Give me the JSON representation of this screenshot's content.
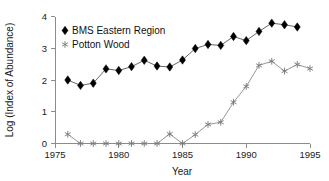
{
  "chart_data": {
    "type": "line",
    "title": "",
    "xlabel": "Year",
    "ylabel": "Log (Index of Abundance)",
    "xlim": [
      1975,
      1995
    ],
    "ylim": [
      0,
      4
    ],
    "xticks": [
      1975,
      1980,
      1985,
      1990,
      1995
    ],
    "yticks": [
      0,
      1,
      2,
      3,
      4
    ],
    "grid": false,
    "legend_position": "top-left",
    "x": [
      1976,
      1977,
      1978,
      1979,
      1980,
      1981,
      1982,
      1983,
      1984,
      1985,
      1986,
      1987,
      1988,
      1989,
      1990,
      1991,
      1992,
      1993,
      1994
    ],
    "series": [
      {
        "name": "BMS Eastern Region",
        "marker": "diamond",
        "color": "#000000",
        "values": [
          2.0,
          1.83,
          1.9,
          2.35,
          2.3,
          2.42,
          2.62,
          2.44,
          2.41,
          2.63,
          2.99,
          3.12,
          3.09,
          3.37,
          3.24,
          3.53,
          3.79,
          3.74,
          3.67
        ]
      },
      {
        "name": "Potton Wood",
        "marker": "star",
        "color": "#777777",
        "values": [
          0.29,
          0.0,
          0.0,
          0.0,
          0.0,
          0.0,
          0.0,
          0.0,
          0.3,
          0.0,
          0.28,
          0.6,
          0.67,
          1.3,
          1.8,
          2.46,
          2.59,
          2.28,
          2.49
        ],
        "extra_x": [
          1995
        ],
        "extra_values": [
          2.36
        ]
      }
    ],
    "legend": [
      {
        "label": "BMS Eastern Region",
        "marker": "diamond"
      },
      {
        "label": "Potton Wood",
        "marker": "star"
      }
    ]
  },
  "axis": {
    "x_tick_labels": [
      "1975",
      "1980",
      "1985",
      "1990",
      "1995"
    ],
    "y_tick_labels": [
      "0",
      "1",
      "2",
      "3",
      "4"
    ],
    "x_title": "Year",
    "y_title": "Log (Index of Abundance)"
  },
  "legend": {
    "item_1": "BMS Eastern Region",
    "item_2": "Potton Wood"
  }
}
